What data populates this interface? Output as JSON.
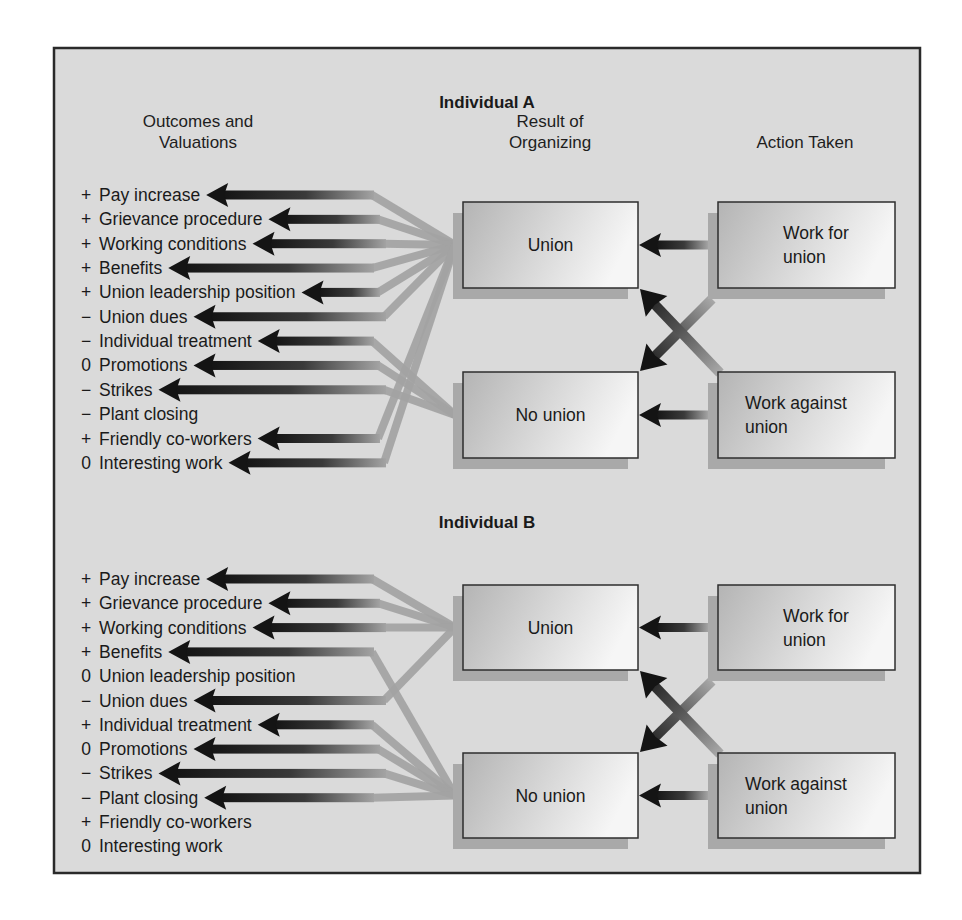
{
  "diagram": {
    "colors": {
      "background": "#dadada",
      "border": "#2a2a2a",
      "arrow_dark": "#141414",
      "arrow_light": "#a3a3a3",
      "box_dark": "#b4b4b4",
      "box_light": "#f6f6f6",
      "shadow": "#a9a9a9"
    },
    "columns": {
      "outcomes": [
        "Outcomes and",
        "Valuations"
      ],
      "result": [
        "Result of",
        "Organizing"
      ],
      "action": [
        "Action Taken"
      ]
    },
    "sections": [
      {
        "title": "Individual A",
        "results": [
          {
            "label": [
              "Union"
            ]
          },
          {
            "label": [
              "No union"
            ]
          }
        ],
        "actions": [
          {
            "label": [
              "Work for",
              "union"
            ]
          },
          {
            "label": [
              "Work against",
              "union"
            ]
          }
        ],
        "outcomes": [
          {
            "sign": "+",
            "label": "Pay increase",
            "source": "union"
          },
          {
            "sign": "+",
            "label": "Grievance procedure",
            "source": "union"
          },
          {
            "sign": "+",
            "label": "Working conditions",
            "source": "union"
          },
          {
            "sign": "+",
            "label": "Benefits",
            "source": "union"
          },
          {
            "sign": "+",
            "label": "Union leadership position",
            "source": "union"
          },
          {
            "sign": "−",
            "label": "Union dues",
            "source": "union"
          },
          {
            "sign": "−",
            "label": "Individual treatment",
            "source": "no_union"
          },
          {
            "sign": "0",
            "label": "Promotions",
            "source": "no_union"
          },
          {
            "sign": "−",
            "label": "Strikes",
            "source": "no_union"
          },
          {
            "sign": "−",
            "label": "Plant closing",
            "source": null
          },
          {
            "sign": "+",
            "label": "Friendly co-workers",
            "source": "union"
          },
          {
            "sign": "0",
            "label": "Interesting work",
            "source": "union"
          }
        ]
      },
      {
        "title": "Individual B",
        "results": [
          {
            "label": [
              "Union"
            ]
          },
          {
            "label": [
              "No union"
            ]
          }
        ],
        "actions": [
          {
            "label": [
              "Work for",
              "union"
            ]
          },
          {
            "label": [
              "Work against",
              "union"
            ]
          }
        ],
        "outcomes": [
          {
            "sign": "+",
            "label": "Pay increase",
            "source": "union"
          },
          {
            "sign": "+",
            "label": "Grievance procedure",
            "source": "union"
          },
          {
            "sign": "+",
            "label": "Working conditions",
            "source": "union"
          },
          {
            "sign": "+",
            "label": "Benefits",
            "source": "no_union"
          },
          {
            "sign": "0",
            "label": "Union leadership position",
            "source": null
          },
          {
            "sign": "−",
            "label": "Union dues",
            "source": "union"
          },
          {
            "sign": "+",
            "label": "Individual treatment",
            "source": "no_union"
          },
          {
            "sign": "0",
            "label": "Promotions",
            "source": "no_union"
          },
          {
            "sign": "−",
            "label": "Strikes",
            "source": "no_union"
          },
          {
            "sign": "−",
            "label": "Plant closing",
            "source": "no_union"
          },
          {
            "sign": "+",
            "label": "Friendly co-workers",
            "source": null
          },
          {
            "sign": "0",
            "label": "Interesting work",
            "source": null
          }
        ]
      }
    ]
  }
}
